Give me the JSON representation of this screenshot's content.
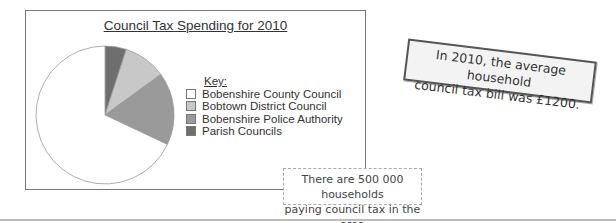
{
  "chart_data": {
    "type": "pie",
    "title": "Council Tax Spending for 2010",
    "legend_title": "Key:",
    "legend_position": "right",
    "categories": [
      "Bobenshire County Council",
      "Bobtown District Council",
      "Bobenshire Police Authority",
      "Parish Councils"
    ],
    "values": [
      68,
      10,
      17,
      5
    ],
    "unit": "approx. % of total (read from slice angles)",
    "colors": [
      "#ffffff",
      "#c8c8c8",
      "#9a9a9a",
      "#6e6e6e"
    ]
  },
  "chart": {
    "title": "Council Tax Spending for 2010",
    "key_label": "Key:",
    "legend": [
      {
        "label": "Bobenshire County Council",
        "color": "#ffffff"
      },
      {
        "label": "Bobtown District Council",
        "color": "#c8c8c8"
      },
      {
        "label": "Bobenshire Police Authority",
        "color": "#9a9a9a"
      },
      {
        "label": "Parish Councils",
        "color": "#6e6e6e"
      }
    ]
  },
  "note": {
    "line1": "In 2010, the average household",
    "line2": "council tax bill was £1200."
  },
  "callout": {
    "line1": "There are 500 000 households",
    "line2": "paying council tax in the area"
  }
}
